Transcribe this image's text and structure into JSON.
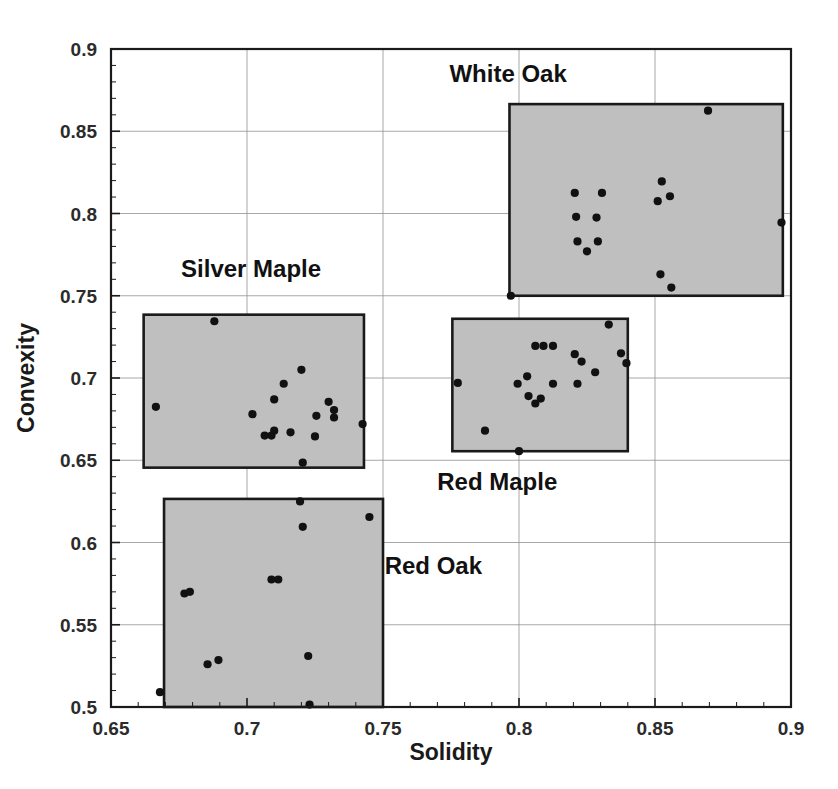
{
  "chart_data": {
    "type": "scatter",
    "title": "",
    "xlabel": "Solidity",
    "ylabel": "Convexity",
    "xlim": [
      0.65,
      0.9
    ],
    "ylim": [
      0.5,
      0.9
    ],
    "xticks": [
      "0.65",
      "0.7",
      "0.75",
      "0.8",
      "0.85",
      "0.9"
    ],
    "xtick_values": [
      0.65,
      0.7,
      0.75,
      0.8,
      0.85,
      0.9
    ],
    "yticks": [
      "0.5",
      "0.55",
      "0.6",
      "0.65",
      "0.7",
      "0.75",
      "0.8",
      "0.85",
      "0.9"
    ],
    "ytick_values": [
      0.5,
      0.55,
      0.6,
      0.65,
      0.7,
      0.75,
      0.8,
      0.85,
      0.9
    ],
    "grid": true,
    "legend_position": "inline-annotations",
    "minor_ticks": true,
    "marker_color": "#111111",
    "box_fill_color": "#bfbfbf",
    "box_border_color": "#1a1a1a",
    "grid_color": "#8c8c8c",
    "frame_color": "#1a1a1a",
    "series": [
      {
        "name": "White Oak",
        "label": "White Oak",
        "label_x": 0.796,
        "label_y": 0.885,
        "box": {
          "x0": 0.7965,
          "x1": 0.897,
          "y0": 0.75,
          "y1": 0.8665
        },
        "points": [
          {
            "x": 0.8695,
            "y": 0.8625
          },
          {
            "x": 0.8525,
            "y": 0.8195
          },
          {
            "x": 0.8555,
            "y": 0.8105
          },
          {
            "x": 0.851,
            "y": 0.8075
          },
          {
            "x": 0.8205,
            "y": 0.8125
          },
          {
            "x": 0.8305,
            "y": 0.8125
          },
          {
            "x": 0.8965,
            "y": 0.7945
          },
          {
            "x": 0.821,
            "y": 0.798
          },
          {
            "x": 0.8285,
            "y": 0.7975
          },
          {
            "x": 0.8215,
            "y": 0.783
          },
          {
            "x": 0.825,
            "y": 0.777
          },
          {
            "x": 0.829,
            "y": 0.783
          },
          {
            "x": 0.852,
            "y": 0.763
          },
          {
            "x": 0.856,
            "y": 0.755
          },
          {
            "x": 0.797,
            "y": 0.75
          }
        ]
      },
      {
        "name": "Silver Maple",
        "label": "Silver Maple",
        "label_x": 0.7015,
        "label_y": 0.7665,
        "box": {
          "x0": 0.662,
          "x1": 0.743,
          "y0": 0.6455,
          "y1": 0.7385
        },
        "points": [
          {
            "x": 0.688,
            "y": 0.7345
          },
          {
            "x": 0.72,
            "y": 0.705
          },
          {
            "x": 0.7135,
            "y": 0.6965
          },
          {
            "x": 0.6665,
            "y": 0.6825
          },
          {
            "x": 0.71,
            "y": 0.687
          },
          {
            "x": 0.73,
            "y": 0.6855
          },
          {
            "x": 0.732,
            "y": 0.6805
          },
          {
            "x": 0.702,
            "y": 0.678
          },
          {
            "x": 0.7255,
            "y": 0.677
          },
          {
            "x": 0.732,
            "y": 0.676
          },
          {
            "x": 0.7425,
            "y": 0.672
          },
          {
            "x": 0.71,
            "y": 0.668
          },
          {
            "x": 0.709,
            "y": 0.665
          },
          {
            "x": 0.716,
            "y": 0.667
          },
          {
            "x": 0.725,
            "y": 0.6645
          },
          {
            "x": 0.7205,
            "y": 0.6485
          },
          {
            "x": 0.7065,
            "y": 0.665
          }
        ]
      },
      {
        "name": "Red Maple",
        "label": "Red Maple",
        "label_x": 0.792,
        "label_y": 0.6365,
        "box": {
          "x0": 0.7755,
          "x1": 0.84,
          "y0": 0.6555,
          "y1": 0.736
        },
        "points": [
          {
            "x": 0.833,
            "y": 0.7325
          },
          {
            "x": 0.8375,
            "y": 0.715
          },
          {
            "x": 0.806,
            "y": 0.7195
          },
          {
            "x": 0.809,
            "y": 0.7195
          },
          {
            "x": 0.8125,
            "y": 0.7195
          },
          {
            "x": 0.8205,
            "y": 0.7145
          },
          {
            "x": 0.823,
            "y": 0.71
          },
          {
            "x": 0.8395,
            "y": 0.709
          },
          {
            "x": 0.828,
            "y": 0.7035
          },
          {
            "x": 0.803,
            "y": 0.701
          },
          {
            "x": 0.7775,
            "y": 0.697
          },
          {
            "x": 0.7995,
            "y": 0.6965
          },
          {
            "x": 0.8125,
            "y": 0.6965
          },
          {
            "x": 0.8215,
            "y": 0.6965
          },
          {
            "x": 0.8035,
            "y": 0.689
          },
          {
            "x": 0.808,
            "y": 0.6875
          },
          {
            "x": 0.806,
            "y": 0.6845
          },
          {
            "x": 0.7875,
            "y": 0.668
          },
          {
            "x": 0.8,
            "y": 0.6555
          }
        ]
      },
      {
        "name": "Red Oak",
        "label": "Red Oak",
        "label_x": 0.7685,
        "label_y": 0.586,
        "box": {
          "x0": 0.6695,
          "x1": 0.75,
          "y0": 0.5,
          "y1": 0.6265
        },
        "points": [
          {
            "x": 0.7195,
            "y": 0.625
          },
          {
            "x": 0.745,
            "y": 0.6155
          },
          {
            "x": 0.7205,
            "y": 0.6095
          },
          {
            "x": 0.709,
            "y": 0.5775
          },
          {
            "x": 0.7115,
            "y": 0.5775
          },
          {
            "x": 0.677,
            "y": 0.569
          },
          {
            "x": 0.679,
            "y": 0.57
          },
          {
            "x": 0.7225,
            "y": 0.531
          },
          {
            "x": 0.6855,
            "y": 0.526
          },
          {
            "x": 0.6895,
            "y": 0.5285
          },
          {
            "x": 0.668,
            "y": 0.509
          },
          {
            "x": 0.723,
            "y": 0.5015
          }
        ]
      }
    ]
  }
}
